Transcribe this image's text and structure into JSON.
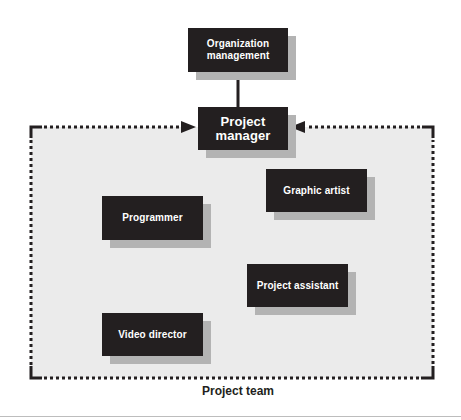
{
  "diagram": {
    "title_label": "Project team",
    "colors": {
      "box_fill": "#231f20",
      "box_text": "#ffffff",
      "shadow": "#b3b3b3",
      "team_area": "#ebebeb",
      "frame": "#231f20"
    },
    "nodes": {
      "org_management": "Organization\nmanagement",
      "project_manager": "Project\nmanager",
      "programmer": "Programmer",
      "graphic_artist": "Graphic artist",
      "project_assistant": "Project assistant",
      "video_director": "Video director"
    },
    "edges": [
      {
        "from": "org_management",
        "to": "project_manager",
        "style": "solid"
      },
      {
        "from": "project_team_frame",
        "to": "project_manager",
        "style": "dotted-arrow-left-side"
      },
      {
        "from": "project_team_frame",
        "to": "project_manager",
        "style": "dotted-arrow-right-side"
      }
    ]
  }
}
